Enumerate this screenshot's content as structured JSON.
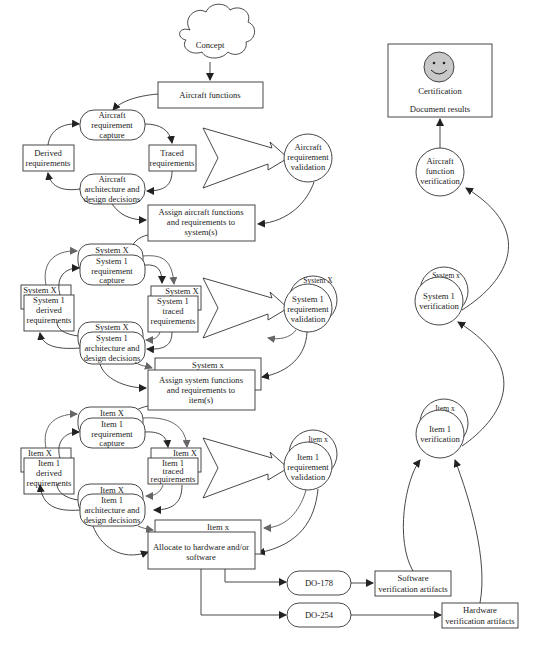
{
  "concept": "Concept",
  "aircraft": {
    "functions": "Aircraft functions",
    "capture": [
      "Aircraft",
      "requirement",
      "capture"
    ],
    "derived": [
      "Derived",
      "requirements"
    ],
    "traced": [
      "Traced",
      "requirements"
    ],
    "architecture": [
      "Aircraft",
      "architecture and",
      "design decisions"
    ],
    "validation": [
      "Aircraft",
      "requirement",
      "validation"
    ],
    "assign": [
      "Assign aircraft functions",
      "and requirements to",
      "system(s)"
    ]
  },
  "system": {
    "label_X": "System X",
    "label_x": "System x",
    "capture": [
      "System 1",
      "requirement",
      "capture"
    ],
    "derived": [
      "System 1",
      "derived",
      "requirements"
    ],
    "traced": [
      "System 1",
      "traced",
      "requirements"
    ],
    "architecture": [
      "System 1",
      "architecture and",
      "design decisions"
    ],
    "validation": [
      "System 1",
      "requirement",
      "validation"
    ],
    "assign": [
      "Assign system functions",
      "and requirements to",
      "item(s)"
    ]
  },
  "item": {
    "label_X": "Item X",
    "label_x": "Item x",
    "capture": [
      "Item 1",
      "requirement",
      "capture"
    ],
    "derived": [
      "Item 1",
      "derived",
      "requirements"
    ],
    "traced": [
      "Item 1",
      "traced",
      "requirements"
    ],
    "architecture": [
      "Item 1",
      "architecture and",
      "design decisions"
    ],
    "validation": [
      "Item 1",
      "requirement",
      "validation"
    ],
    "allocate": [
      "Allocate to hardware and/or",
      "software"
    ]
  },
  "standards": {
    "software": "DO-178",
    "hardware": "DO-254"
  },
  "artifacts": {
    "software": [
      "Software",
      "verification artifacts"
    ],
    "hardware": [
      "Hardware",
      "verification artifacts"
    ]
  },
  "verification": {
    "item": [
      "Item 1",
      "verification"
    ],
    "item_stack": "Item x",
    "system": [
      "System 1",
      "verification"
    ],
    "system_stack": "System x",
    "aircraft": [
      "Aircraft",
      "function",
      "verification"
    ]
  },
  "certification": {
    "title": "Certification",
    "subtitle": "Document results",
    "icon": "smiley-face-icon"
  },
  "colors": {
    "stroke": "#333333",
    "gray_arrow": "#666666",
    "smiley_fill": "#c8c8c8"
  }
}
